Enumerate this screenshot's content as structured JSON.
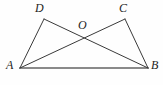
{
  "figure": {
    "kind": "plane-geometry-diagram",
    "canvas": {
      "width": 163,
      "height": 85,
      "background": "#fefefe"
    },
    "style": {
      "stroke_color": "#3a3a3a",
      "stroke_color_base": "#8a8a8a",
      "stroke_width": 1,
      "stroke_width_base": 2,
      "label_color": "#1d1d1d"
    },
    "points": [
      {
        "id": "A",
        "label": "A",
        "x": 20,
        "y": 68
      },
      {
        "id": "B",
        "label": "B",
        "x": 148,
        "y": 68
      },
      {
        "id": "C",
        "label": "C",
        "x": 125,
        "y": 19
      },
      {
        "id": "D",
        "label": "D",
        "x": 44,
        "y": 19
      },
      {
        "id": "O",
        "label": "O",
        "x": 85,
        "y": 39
      }
    ],
    "segments": [
      {
        "id": "AD",
        "from": "A",
        "to": "D",
        "x1": 20,
        "y1": 68,
        "x2": 44,
        "y2": 19
      },
      {
        "id": "CB",
        "from": "C",
        "to": "B",
        "x1": 125,
        "y1": 19,
        "x2": 148,
        "y2": 68
      },
      {
        "id": "AC",
        "from": "A",
        "to": "C",
        "x1": 20,
        "y1": 68,
        "x2": 125,
        "y2": 19
      },
      {
        "id": "DB",
        "from": "D",
        "to": "B",
        "x1": 44,
        "y1": 19,
        "x2": 148,
        "y2": 68
      },
      {
        "id": "AB",
        "from": "A",
        "to": "B",
        "x1": 20,
        "y1": 68,
        "x2": 148,
        "y2": 68
      }
    ],
    "labels": {
      "A": "A",
      "B": "B",
      "C": "C",
      "D": "D",
      "O": "O"
    }
  }
}
